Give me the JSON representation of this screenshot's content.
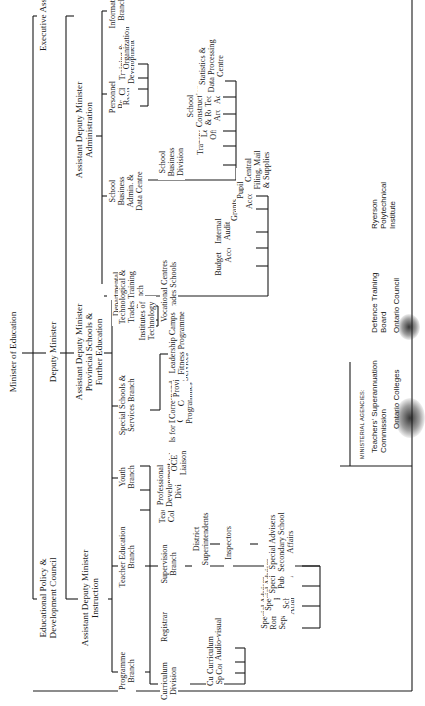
{
  "chart": {
    "orientation": "rotated-90-ccw",
    "root": "Minister of Education",
    "top_level": {
      "executive_assistant": "Executive Assistant",
      "deputy_minister": "Deputy Minister",
      "policy_council": "Educational Policy &\nDevelopment Council"
    },
    "adm_administration": {
      "title": "Assistant Deputy Minister\nAdministration",
      "departmental_business_admin": {
        "title": "Departmental\nBusiness Admin.",
        "children": [
          "Budget",
          "Accounts",
          "Internal\nAudit",
          "Grants",
          "Pupil\nAccounting",
          "Central\nFiling, Mail\n& Supplies"
        ]
      },
      "school_business_admin": {
        "title": "School\nBusiness\nAdmin. &\nData Centre",
        "children": [
          "School\nBusiness\nDivision",
          "Transportation",
          "Legal\nOfficer",
          "School\nConstruction\n& Research\nArchitect",
          "Technical\nAdviser",
          "Statistics &\nData Processing\nCentre"
        ]
      },
      "personnel_branch": {
        "title": "Personnel\nBranch",
        "children": [
          "Recruitment",
          "Classification",
          "Training &\nDevelopment",
          "Organization"
        ]
      },
      "information_branch": {
        "title": "Information\nBranch"
      }
    },
    "adm_provincial": {
      "title": "Assistant Deputy Minister\nProvincial Schools &\nFurther Education",
      "technological_trades": {
        "title": "Technological &\nTrades Training\nBranch",
        "children": [
          "Institutes of\nTechnology",
          "Vocational Centres\n& Trades Schools"
        ]
      },
      "special_schools": {
        "title": "Special Schools &\nServices Branch",
        "children": [
          "Schools for Deaf,\nBlind",
          "Community Programmes",
          "Correspondence\nCourses",
          "Provincial Library\nServices",
          "Leadership Camps\nFitness Programme"
        ]
      },
      "youth_branch": {
        "title": "Youth\nBranch"
      }
    },
    "adm_instruction": {
      "title": "Assistant Deputy Minister\nInstruction",
      "teacher_education": {
        "title": "Teacher Education\nBranch",
        "children": [
          "Teachers'\nColleges",
          "Professional\nDevelopment\nDivision",
          "OCE Liaison"
        ]
      },
      "programme_branch": {
        "title": "Programme\nBranch",
        "registrar": "Registrar",
        "supervision_branch": {
          "title": "Supervision\nBranch",
          "district_superintendents": "District\nSuperintendents",
          "inspectors": "Inspectors",
          "children": [
            "Special Adviser\nRoman Catholic\nSeparate School\nAffairs",
            "Special Adviser\nBilingual\nSchool Affairs",
            "Special Advisers\nPublic School\nAffairs",
            "Special Advisers\nSecondary School\nAffairs"
          ]
        },
        "curriculum_division": {
          "title": "Curriculum\nDivision",
          "children": [
            "Curriculum\nSpecialists",
            "Curriculum\nCommittees",
            "Audio-visual"
          ]
        }
      }
    },
    "ministerial_agencies": {
      "heading": "MINISTERIAL AGENCIES:",
      "items": [
        "Teachers' Superannuation\nCommission",
        "Ontario Colleges",
        "Defence Training\nBoard",
        "Ontario Council",
        "Ryerson\nPolytechnical\nInstitute"
      ]
    }
  }
}
